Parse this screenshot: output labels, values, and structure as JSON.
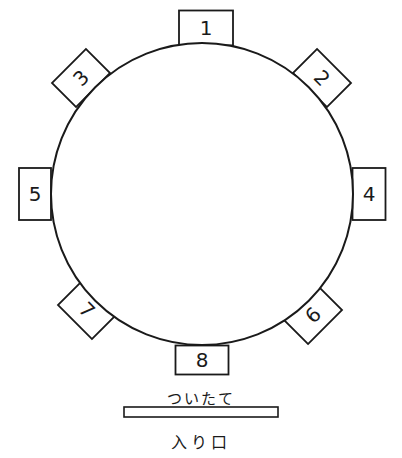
{
  "diagram": {
    "type": "seating-chart",
    "table": {
      "shape": "round",
      "cx": 202,
      "cy": 194,
      "r": 151
    },
    "seats": [
      {
        "id": "seat-1",
        "label": "1",
        "cx": 206,
        "cy": 28,
        "w": 54,
        "h": 35,
        "angle": 0
      },
      {
        "id": "seat-2",
        "label": "2",
        "cx": 322,
        "cy": 78,
        "w": 48,
        "h": 34,
        "angle": 45
      },
      {
        "id": "seat-3",
        "label": "3",
        "cx": 81,
        "cy": 78,
        "w": 48,
        "h": 34,
        "angle": -45
      },
      {
        "id": "seat-4",
        "label": "4",
        "cx": 369,
        "cy": 194,
        "w": 33,
        "h": 52,
        "angle": 0
      },
      {
        "id": "seat-5",
        "label": "5",
        "cx": 35,
        "cy": 194,
        "w": 32,
        "h": 52,
        "angle": 0
      },
      {
        "id": "seat-6",
        "label": "6",
        "cx": 313,
        "cy": 315,
        "w": 48,
        "h": 34,
        "angle": -45
      },
      {
        "id": "seat-7",
        "label": "7",
        "cx": 87,
        "cy": 310,
        "w": 48,
        "h": 34,
        "angle": 45
      },
      {
        "id": "seat-8",
        "label": "8",
        "cx": 202,
        "cy": 360,
        "w": 53,
        "h": 29,
        "angle": 0
      }
    ],
    "screen": {
      "label": "ついたて",
      "x": 124,
      "y": 407,
      "w": 154,
      "h": 10
    },
    "entrance": {
      "label": "入り口"
    }
  },
  "colors": {
    "stroke": "#1a1a1a",
    "background": "#ffffff"
  }
}
